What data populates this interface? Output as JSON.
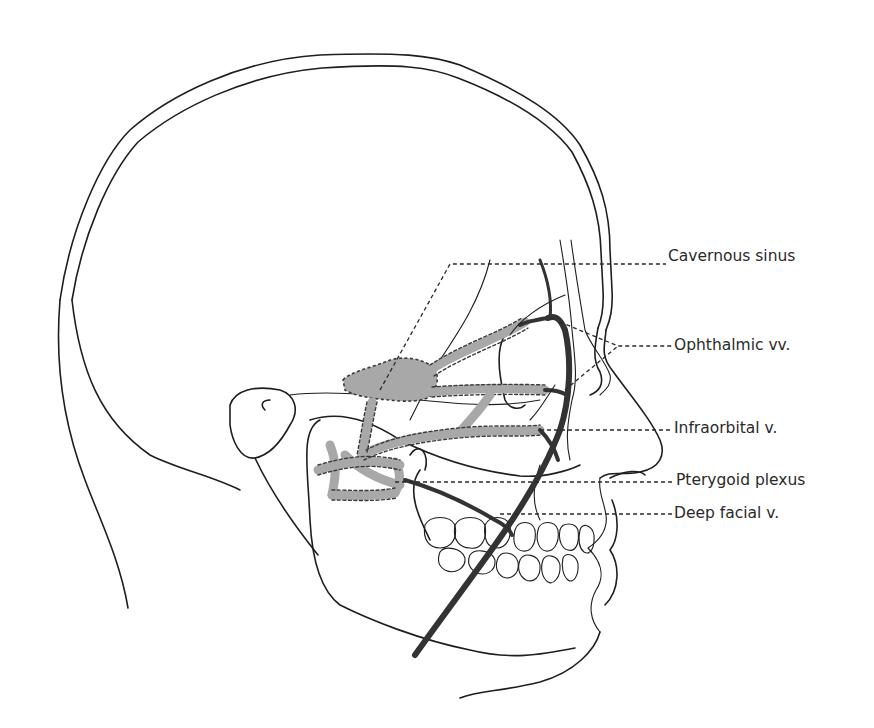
{
  "figure": {
    "labels": [
      {
        "id": "cavernous-sinus",
        "text": "Cavernous sinus",
        "x": 668,
        "y": 249
      },
      {
        "id": "ophthalmic-vv",
        "text": "Ophthalmic vv.",
        "x": 674,
        "y": 338
      },
      {
        "id": "infraorbital-v",
        "text": "Infraorbital v.",
        "x": 674,
        "y": 421
      },
      {
        "id": "pterygoid-plexus",
        "text": "Pterygoid plexus",
        "x": 676,
        "y": 473
      },
      {
        "id": "deep-facial-v",
        "text": "Deep facial v.",
        "x": 674,
        "y": 508
      }
    ],
    "colors": {
      "line": "#1e1e1e",
      "vein": "#333333",
      "plexus_fill": "#a8a8a8",
      "background": "#ffffff"
    }
  }
}
